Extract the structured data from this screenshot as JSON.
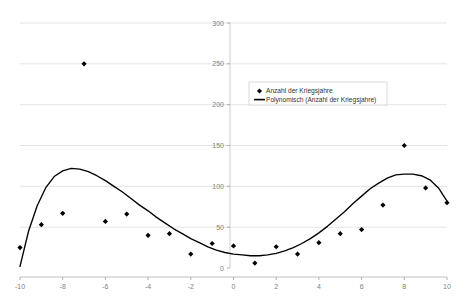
{
  "chart_data": {
    "type": "scatter",
    "title": "",
    "subtitle": "",
    "xlabel": "",
    "ylabel": "",
    "xlim": [
      -10,
      10
    ],
    "ylim": [
      0,
      300
    ],
    "xticks": [
      -10,
      -8,
      -6,
      -4,
      -2,
      0,
      2,
      4,
      6,
      8,
      10
    ],
    "xtick_labels": [
      "-10",
      "-8",
      "-6",
      "-4",
      "-2",
      "0",
      "2",
      "4",
      "6",
      "8",
      "10"
    ],
    "yticks": [
      0,
      50,
      100,
      150,
      200,
      250,
      300
    ],
    "ytick_labels": [
      "0",
      "50",
      "100",
      "150",
      "200",
      "250",
      "300"
    ],
    "grid": "horizontal",
    "legend_position": "inside-upper-center-right",
    "series": [
      {
        "name": "Anzahl der Kriegsjahre",
        "type": "scatter",
        "marker": "diamond",
        "color": "#000000",
        "x": [
          -10,
          -9,
          -8,
          -7,
          -6,
          -5,
          -4,
          -3,
          -2,
          -1,
          0,
          1,
          2,
          3,
          4,
          5,
          6,
          7,
          8,
          9,
          10
        ],
        "values": [
          25,
          53,
          67,
          250,
          57,
          66,
          40,
          42,
          17,
          30,
          27,
          6,
          26,
          17,
          31,
          42,
          47,
          77,
          150,
          98,
          80
        ]
      },
      {
        "name": "Polynomisch (Anzahl der Kriegsjahre)",
        "type": "line",
        "color": "#000000",
        "x": [
          -10.0,
          -9.6,
          -9.2,
          -8.8,
          -8.4,
          -8.0,
          -7.6,
          -7.2,
          -6.8,
          -6.4,
          -6.0,
          -5.6,
          -5.2,
          -4.8,
          -4.4,
          -4.0,
          -3.6,
          -3.2,
          -2.8,
          -2.4,
          -2.0,
          -1.6,
          -1.2,
          -0.8,
          -0.4,
          0.0,
          0.4,
          0.8,
          1.2,
          1.6,
          2.0,
          2.4,
          2.8,
          3.2,
          3.6,
          4.0,
          4.4,
          4.8,
          5.2,
          5.6,
          6.0,
          6.4,
          6.8,
          7.2,
          7.6,
          8.0,
          8.4,
          8.8,
          9.2,
          9.6,
          10.0
        ],
        "values": [
          2,
          45,
          76,
          98,
          112,
          119,
          122,
          121,
          118,
          113,
          107,
          100,
          93,
          85,
          77,
          70,
          62,
          55,
          48,
          42,
          36,
          31,
          26,
          22,
          19,
          17,
          16,
          15,
          15,
          16,
          18,
          21,
          25,
          30,
          36,
          43,
          51,
          60,
          69,
          79,
          88,
          97,
          104,
          110,
          114,
          115,
          115,
          113,
          108,
          98,
          82
        ]
      }
    ],
    "legend_entries": [
      {
        "label": "Anzahl der Kriegsjahre",
        "marker": "diamond",
        "color": "#000000"
      },
      {
        "label": "Polynomisch (Anzahl der Kriegsjahre)",
        "marker": "line",
        "color": "#000000"
      }
    ]
  },
  "axes": {
    "x_tick_0": "-10",
    "x_tick_1": "-8",
    "x_tick_2": "-6",
    "x_tick_3": "-4",
    "x_tick_4": "-2",
    "x_tick_5": "0",
    "x_tick_6": "2",
    "x_tick_7": "4",
    "x_tick_8": "6",
    "x_tick_9": "8",
    "x_tick_10": "10",
    "y_tick_0": "0",
    "y_tick_1": "50",
    "y_tick_2": "100",
    "y_tick_3": "150",
    "y_tick_4": "200",
    "y_tick_5": "250",
    "y_tick_6": "300"
  },
  "colors": {
    "series": "#000000",
    "grid": "#d9d9d9",
    "axis": "#808080",
    "text": "#808080",
    "legend_border": "#c8c8d2",
    "background": "#ffffff"
  }
}
